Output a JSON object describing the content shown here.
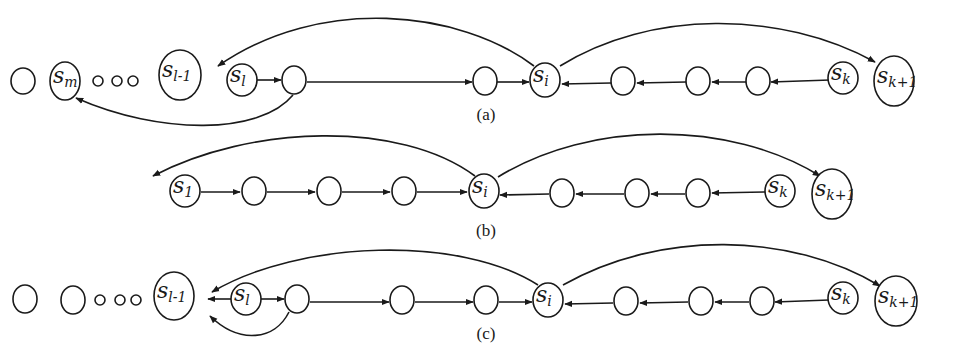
{
  "figure": {
    "panels": [
      {
        "id": "a",
        "caption": "(a)",
        "caption_pos": [
          486,
          120
        ],
        "nodes": [
          {
            "x": 23,
            "y": 81,
            "rx": 12,
            "ry": 13,
            "main": "",
            "sub": ""
          },
          {
            "x": 65,
            "y": 81,
            "rx": 15,
            "ry": 19,
            "main": "s",
            "sub": "m"
          },
          {
            "x": 98,
            "y": 81,
            "rx": 5,
            "ry": 5,
            "main": "",
            "sub": ""
          },
          {
            "x": 117,
            "y": 81,
            "rx": 5,
            "ry": 5,
            "main": "",
            "sub": ""
          },
          {
            "x": 133,
            "y": 81,
            "rx": 5,
            "ry": 5,
            "main": "",
            "sub": ""
          },
          {
            "x": 180,
            "y": 75,
            "rx": 21,
            "ry": 25,
            "main": "s",
            "sub": "l-1"
          },
          {
            "x": 242,
            "y": 80,
            "rx": 15,
            "ry": 16,
            "main": "s",
            "sub": "l"
          },
          {
            "x": 294,
            "y": 80,
            "rx": 12,
            "ry": 14,
            "main": "",
            "sub": ""
          },
          {
            "x": 485,
            "y": 81,
            "rx": 12,
            "ry": 14,
            "main": "",
            "sub": ""
          },
          {
            "x": 545,
            "y": 80,
            "rx": 15,
            "ry": 17,
            "main": "s",
            "sub": "i"
          },
          {
            "x": 623,
            "y": 81,
            "rx": 12,
            "ry": 14,
            "main": "",
            "sub": ""
          },
          {
            "x": 698,
            "y": 81,
            "rx": 12,
            "ry": 14,
            "main": "",
            "sub": ""
          },
          {
            "x": 758,
            "y": 81,
            "rx": 12,
            "ry": 14,
            "main": "",
            "sub": ""
          },
          {
            "x": 843,
            "y": 78,
            "rx": 15,
            "ry": 16,
            "main": "s",
            "sub": "k"
          },
          {
            "x": 894,
            "y": 81,
            "rx": 20,
            "ry": 25,
            "main": "s",
            "sub": "k+1"
          }
        ],
        "edges": [
          {
            "d": "M257,80 L281,80",
            "arrow": true
          },
          {
            "d": "M307,82 L472,82",
            "arrow": true
          },
          {
            "d": "M497,82 L529,82",
            "arrow": true
          },
          {
            "d": "M830,80 L771,82",
            "arrow": true
          },
          {
            "d": "M746,82 L712,82",
            "arrow": true
          },
          {
            "d": "M686,82 L637,83",
            "arrow": true
          },
          {
            "d": "M611,83 L562,84",
            "arrow": true
          },
          {
            "d": "M534,66 C460,10 320,-5 218,66",
            "arrow": true
          },
          {
            "d": "M560,66 C650,10 780,10 875,62",
            "arrow": true
          },
          {
            "d": "M293,95 C260,135 160,135 76,98",
            "arrow": true
          }
        ]
      },
      {
        "id": "b",
        "caption": "(b)",
        "caption_pos": [
          486,
          236
        ],
        "nodes": [
          {
            "x": 185,
            "y": 191,
            "rx": 15,
            "ry": 16,
            "main": "s",
            "sub": "1"
          },
          {
            "x": 254,
            "y": 191,
            "rx": 12,
            "ry": 14,
            "main": "",
            "sub": ""
          },
          {
            "x": 329,
            "y": 191,
            "rx": 12,
            "ry": 14,
            "main": "",
            "sub": ""
          },
          {
            "x": 404,
            "y": 191,
            "rx": 12,
            "ry": 14,
            "main": "",
            "sub": ""
          },
          {
            "x": 484,
            "y": 191,
            "rx": 15,
            "ry": 17,
            "main": "s",
            "sub": "i"
          },
          {
            "x": 562,
            "y": 193,
            "rx": 12,
            "ry": 14,
            "main": "",
            "sub": ""
          },
          {
            "x": 637,
            "y": 193,
            "rx": 12,
            "ry": 14,
            "main": "",
            "sub": ""
          },
          {
            "x": 698,
            "y": 193,
            "rx": 12,
            "ry": 14,
            "main": "",
            "sub": ""
          },
          {
            "x": 780,
            "y": 191,
            "rx": 15,
            "ry": 16,
            "main": "s",
            "sub": "k"
          },
          {
            "x": 832,
            "y": 194,
            "rx": 20,
            "ry": 25,
            "main": "s",
            "sub": "k+1"
          }
        ],
        "edges": [
          {
            "d": "M201,192 L240,192",
            "arrow": true
          },
          {
            "d": "M267,192 L315,192",
            "arrow": true
          },
          {
            "d": "M342,192 L390,192",
            "arrow": true
          },
          {
            "d": "M417,192 L467,192",
            "arrow": true
          },
          {
            "d": "M766,192 L712,193",
            "arrow": true
          },
          {
            "d": "M685,194 L651,194",
            "arrow": true
          },
          {
            "d": "M549,194 L500,195",
            "arrow": true
          },
          {
            "d": "M624,194 L576,194",
            "arrow": true
          },
          {
            "d": "M475,176 C400,120 250,125 153,176",
            "arrow": true
          },
          {
            "d": "M498,177 C590,120 730,120 820,176",
            "arrow": true
          }
        ]
      },
      {
        "id": "c",
        "caption": "(c)",
        "caption_pos": [
          486,
          339
        ],
        "nodes": [
          {
            "x": 25,
            "y": 299,
            "rx": 12,
            "ry": 14,
            "main": "",
            "sub": ""
          },
          {
            "x": 73,
            "y": 300,
            "rx": 12,
            "ry": 14,
            "main": "",
            "sub": ""
          },
          {
            "x": 100,
            "y": 300,
            "rx": 5,
            "ry": 5,
            "main": "",
            "sub": ""
          },
          {
            "x": 120,
            "y": 300,
            "rx": 5,
            "ry": 5,
            "main": "",
            "sub": ""
          },
          {
            "x": 136,
            "y": 300,
            "rx": 5,
            "ry": 5,
            "main": "",
            "sub": ""
          },
          {
            "x": 174,
            "y": 296,
            "rx": 20,
            "ry": 24,
            "main": "s",
            "sub": "l-1"
          },
          {
            "x": 246,
            "y": 299,
            "rx": 15,
            "ry": 16,
            "main": "s",
            "sub": "l"
          },
          {
            "x": 297,
            "y": 299,
            "rx": 12,
            "ry": 14,
            "main": "",
            "sub": ""
          },
          {
            "x": 402,
            "y": 300,
            "rx": 12,
            "ry": 14,
            "main": "",
            "sub": ""
          },
          {
            "x": 486,
            "y": 300,
            "rx": 12,
            "ry": 14,
            "main": "",
            "sub": ""
          },
          {
            "x": 548,
            "y": 300,
            "rx": 15,
            "ry": 17,
            "main": "s",
            "sub": "i"
          },
          {
            "x": 626,
            "y": 301,
            "rx": 12,
            "ry": 14,
            "main": "",
            "sub": ""
          },
          {
            "x": 701,
            "y": 301,
            "rx": 12,
            "ry": 14,
            "main": "",
            "sub": ""
          },
          {
            "x": 762,
            "y": 301,
            "rx": 12,
            "ry": 14,
            "main": "",
            "sub": ""
          },
          {
            "x": 843,
            "y": 298,
            "rx": 15,
            "ry": 16,
            "main": "s",
            "sub": "k"
          },
          {
            "x": 896,
            "y": 301,
            "rx": 21,
            "ry": 25,
            "main": "s",
            "sub": "k+1"
          }
        ],
        "edges": [
          {
            "d": "M231,299 L208,299",
            "arrow": true
          },
          {
            "d": "M261,299 L284,299",
            "arrow": true
          },
          {
            "d": "M310,302 L389,302",
            "arrow": true
          },
          {
            "d": "M415,302 L473,302",
            "arrow": true
          },
          {
            "d": "M499,302 L532,302",
            "arrow": true
          },
          {
            "d": "M829,300 L775,302",
            "arrow": true
          },
          {
            "d": "M749,302 L715,302",
            "arrow": true
          },
          {
            "d": "M688,302 L640,303",
            "arrow": true
          },
          {
            "d": "M613,303 L565,304",
            "arrow": true
          },
          {
            "d": "M538,285 C460,235 300,240 212,292",
            "arrow": true
          },
          {
            "d": "M563,285 C660,230 790,232 880,286",
            "arrow": true
          },
          {
            "d": "M289,312 C275,340 240,345 210,316",
            "arrow": true
          }
        ]
      }
    ]
  }
}
